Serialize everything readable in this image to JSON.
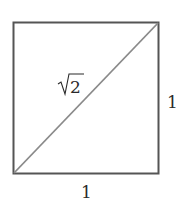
{
  "diagram": {
    "shape": "unit-square-with-diagonal",
    "labels": {
      "diagonal": "√2",
      "diagonal_radicand": "2",
      "right_side": "1",
      "bottom_side": "1"
    },
    "colors": {
      "square_stroke": "#555555",
      "diagonal_stroke": "#8a8a8a",
      "text": "#2a2a2a",
      "background": "#ffffff"
    }
  }
}
